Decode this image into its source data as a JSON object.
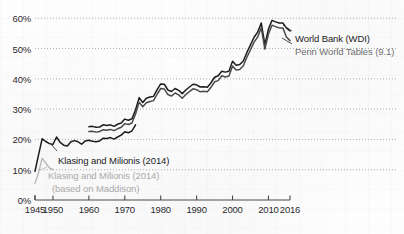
{
  "chart_data": {
    "type": "line",
    "title": "",
    "xlabel": "",
    "ylabel": "",
    "xlim": [
      1945,
      2016
    ],
    "ylim": [
      0,
      65
    ],
    "grid": true,
    "grid_style": "dotted-horizontal",
    "legend_position": "right-inline",
    "y_ticks": [
      "0%",
      "10%",
      "20%",
      "30%",
      "40%",
      "50%",
      "60%"
    ],
    "y_tick_values": [
      0,
      10,
      20,
      30,
      40,
      50,
      60
    ],
    "x_ticks": [
      "1945",
      "1950",
      "1960",
      "1970",
      "1980",
      "1990",
      "2000",
      "2010",
      "2016"
    ],
    "x_tick_values": [
      1945,
      1950,
      1960,
      1970,
      1980,
      1990,
      2000,
      2010,
      2016
    ],
    "series": [
      {
        "name": "World Bank (WDI)",
        "color": "#1c1c1c",
        "label_color": "#1c1c1c",
        "x": [
          1960,
          1961,
          1962,
          1963,
          1964,
          1965,
          1966,
          1967,
          1968,
          1969,
          1970,
          1971,
          1972,
          1973,
          1974,
          1975,
          1976,
          1977,
          1978,
          1979,
          1980,
          1981,
          1982,
          1983,
          1984,
          1985,
          1986,
          1987,
          1988,
          1989,
          1990,
          1991,
          1992,
          1993,
          1994,
          1995,
          1996,
          1997,
          1998,
          1999,
          2000,
          2001,
          2002,
          2003,
          2004,
          2005,
          2006,
          2007,
          2008,
          2009,
          2010,
          2011,
          2012,
          2013,
          2014,
          2015,
          2016
        ],
        "y": [
          24.2,
          24.3,
          24.0,
          24.1,
          24.8,
          24.6,
          24.8,
          24.3,
          25.0,
          25.4,
          26.7,
          26.3,
          26.8,
          29.8,
          33.8,
          32.2,
          33.6,
          34.0,
          34.2,
          36.4,
          38.3,
          38.2,
          36.3,
          35.8,
          36.8,
          36.2,
          35.1,
          36.3,
          37.3,
          38.2,
          38.0,
          37.3,
          37.4,
          37.2,
          38.7,
          40.5,
          41.0,
          42.5,
          42.2,
          42.5,
          45.8,
          44.5,
          44.7,
          45.9,
          48.7,
          51.2,
          53.7,
          55.4,
          58.4,
          51.3,
          56.4,
          59.3,
          58.8,
          58.4,
          58.4,
          56.8,
          55.8
        ]
      },
      {
        "name": "Penn World Tables (9.1)",
        "color": "#4a4a4a",
        "label_color": "#6f6f6f",
        "x": [
          1960,
          1961,
          1962,
          1963,
          1964,
          1965,
          1966,
          1967,
          1968,
          1969,
          1970,
          1971,
          1972,
          1973,
          1974,
          1975,
          1976,
          1977,
          1978,
          1979,
          1980,
          1981,
          1982,
          1983,
          1984,
          1985,
          1986,
          1987,
          1988,
          1989,
          1990,
          1991,
          1992,
          1993,
          1994,
          1995,
          1996,
          1997,
          1998,
          1999,
          2000,
          2001,
          2002,
          2003,
          2004,
          2005,
          2006,
          2007,
          2008,
          2009,
          2010,
          2011,
          2012,
          2013,
          2014,
          2015,
          2016
        ],
        "y": [
          22.6,
          22.7,
          22.4,
          22.6,
          23.2,
          23.0,
          23.3,
          22.9,
          23.5,
          24.0,
          25.2,
          24.9,
          25.4,
          28.4,
          32.3,
          30.8,
          32.1,
          32.5,
          32.8,
          34.9,
          36.8,
          36.6,
          34.8,
          34.3,
          35.3,
          34.7,
          33.6,
          34.8,
          35.8,
          36.7,
          36.4,
          35.7,
          35.9,
          35.7,
          37.2,
          39.0,
          39.4,
          41.0,
          40.6,
          40.9,
          44.2,
          42.9,
          43.1,
          44.3,
          47.1,
          49.6,
          52.1,
          53.8,
          56.8,
          49.8,
          54.8,
          57.7,
          57.2,
          56.8,
          56.8,
          53.8,
          52.6
        ]
      },
      {
        "name": "Klasing and Milionis (2014)",
        "color": "#1c1c1c",
        "label_color": "#1c1c1c",
        "x": [
          1945,
          1946,
          1947,
          1948,
          1949,
          1950,
          1951,
          1952,
          1953,
          1954,
          1955,
          1956,
          1957,
          1958,
          1959,
          1960,
          1961,
          1962,
          1963,
          1964,
          1965,
          1966,
          1967,
          1968,
          1969,
          1970,
          1971,
          1972,
          1973
        ],
        "y": [
          9.5,
          15.0,
          20.2,
          19.3,
          18.6,
          18.3,
          20.8,
          19.0,
          18.1,
          17.8,
          19.2,
          19.6,
          19.2,
          18.4,
          19.5,
          19.7,
          19.4,
          19.2,
          19.5,
          20.4,
          20.3,
          20.6,
          20.1,
          20.8,
          21.4,
          22.5,
          22.2,
          22.8,
          24.8
        ]
      },
      {
        "name": "Klasing and Milionis (2014) (based on Maddison)",
        "color": "#b4b4b4",
        "label_color": "#aaaaaa",
        "x": [
          1945,
          1946,
          1947,
          1948,
          1949,
          1950
        ],
        "y": [
          5.5,
          9.0,
          13.8,
          12.2,
          10.6,
          10.0
        ]
      }
    ],
    "annotations": [
      {
        "id": "klasing-main",
        "text": "Klasing and Milionis (2014)",
        "color": "#1c1c1c",
        "x_px": 58,
        "y_px": 155
      },
      {
        "id": "klasing-maddison-line1",
        "text": "Klasing and Milionis (2014)",
        "color": "#aaaaaa",
        "x_px": 48,
        "y_px": 170
      },
      {
        "id": "klasing-maddison-line2",
        "text": "(based on Maddison)",
        "color": "#aaaaaa",
        "x_px": 52,
        "y_px": 183
      },
      {
        "id": "world-bank",
        "text": "World Bank (WDI)",
        "color": "#1c1c1c",
        "x_px": 295,
        "y_px": 33
      },
      {
        "id": "penn-world-tables",
        "text": "Penn World Tables (9.1)",
        "color": "#6f6f6f",
        "x_px": 295,
        "y_px": 46
      }
    ],
    "colors": {
      "axis": "#4a4a4a",
      "gridline": "#9a9a9a",
      "background": "#fdfdfd",
      "text": "#2b2b2b"
    }
  }
}
